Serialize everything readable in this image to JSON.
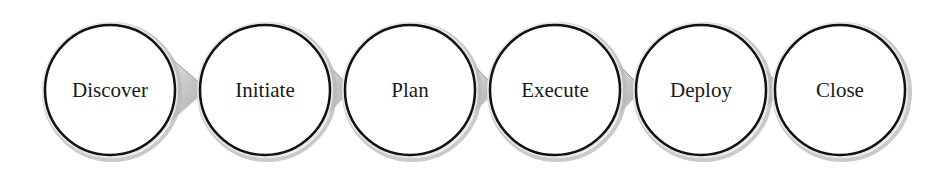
{
  "diagram": {
    "type": "process-flow",
    "steps": [
      {
        "label": "Discover",
        "cx": 110
      },
      {
        "label": "Initiate",
        "cx": 265
      },
      {
        "label": "Plan",
        "cx": 410
      },
      {
        "label": "Execute",
        "cx": 555
      },
      {
        "label": "Deploy",
        "cx": 701
      },
      {
        "label": "Close",
        "cx": 840
      }
    ],
    "cy": 90,
    "radius": 65,
    "colors": {
      "circle_fill": "#ffffff",
      "circle_stroke": "#111111",
      "shadow_ring": "#b8b8b8",
      "arrow_fill": "#d6d6d6",
      "background": "#ffffff"
    }
  }
}
